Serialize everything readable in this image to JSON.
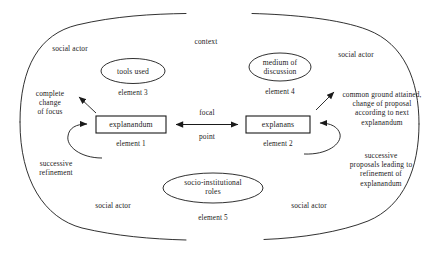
{
  "diagram": {
    "title": "context",
    "outer_region_label": "context",
    "boxes": [
      {
        "id": "explanandum",
        "label": "explanandum",
        "element_label": "element 1"
      },
      {
        "id": "explanans",
        "label": "explanans",
        "element_label": "element 2"
      }
    ],
    "ellipses": [
      {
        "id": "tools-used",
        "label": "tools used",
        "element_label": "element 3"
      },
      {
        "id": "medium-of-discussion",
        "label": "medium of\ndiscussion",
        "element_label": "element 4"
      },
      {
        "id": "socio-institutional-roles",
        "label": "socio-institutional\nroles",
        "element_label": "element 5"
      }
    ],
    "central_relation": {
      "label_top": "focal",
      "label_bottom": "point"
    },
    "annotations": [
      {
        "id": "complete-change-of-focus",
        "text": "complete\nchange\nof focus"
      },
      {
        "id": "successive-refinement",
        "text": "successive\nrefinement"
      },
      {
        "id": "common-ground-attained",
        "text": "common ground attained,\nchange of proposal\naccording to next\nexplanandum"
      },
      {
        "id": "successive-proposals",
        "text": "successive\nproposals leading to\nrefinement of\nexplanandum"
      }
    ],
    "actor_labels": [
      {
        "id": "social-actor-top-left",
        "text": "social actor"
      },
      {
        "id": "social-actor-top-right",
        "text": "social actor"
      },
      {
        "id": "social-actor-bottom-left",
        "text": "social actor"
      },
      {
        "id": "social-actor-bottom-right",
        "text": "social actor"
      }
    ],
    "colors": {
      "stroke": "#1a1a1a",
      "text": "#1a1a1a",
      "background": "#ffffff"
    }
  }
}
